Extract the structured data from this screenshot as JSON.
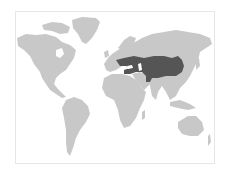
{
  "map": {
    "type": "world-map",
    "colors": {
      "background": "#ffffff",
      "frame_border": "#e6e6e6",
      "land": "#c8c8c8",
      "highlight": "#555555"
    },
    "highlighted_region": {
      "name": "highlighted-region",
      "approx_extent": "Eastern Europe to Manchuria, Central Asia, Mongolia, northern China, Persia/Anatolia"
    },
    "continents": [
      "north-america",
      "greenland",
      "south-america",
      "europe",
      "africa",
      "asia",
      "australia"
    ]
  }
}
